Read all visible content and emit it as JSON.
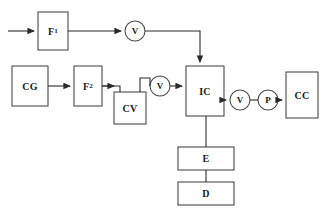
{
  "diagram": {
    "type": "process-flow-block-diagram",
    "title": "",
    "stroke_color": "#4a4a4a",
    "fill_color": "#ffffff",
    "text_color": "#1a1a1a",
    "nodes": [
      {
        "id": "F1",
        "shape": "rect",
        "label": "F",
        "subscript": "1",
        "x": 38,
        "y": 12,
        "w": 30,
        "h": 38
      },
      {
        "id": "V1",
        "shape": "circle",
        "label": "V",
        "subscript": "",
        "cx": 135,
        "cy": 31,
        "r": 10
      },
      {
        "id": "CG",
        "shape": "rect",
        "label": "CG",
        "subscript": "",
        "x": 12,
        "y": 66,
        "w": 36,
        "h": 40
      },
      {
        "id": "F2",
        "shape": "rect",
        "label": "F",
        "subscript": "2",
        "x": 74,
        "y": 66,
        "w": 28,
        "h": 40
      },
      {
        "id": "CV",
        "shape": "rect",
        "label": "CV",
        "subscript": "",
        "x": 114,
        "y": 92,
        "w": 32,
        "h": 32
      },
      {
        "id": "V2",
        "shape": "circle",
        "label": "V",
        "subscript": "",
        "cx": 160,
        "cy": 86,
        "r": 10
      },
      {
        "id": "IC",
        "shape": "rect",
        "label": "IC",
        "subscript": "",
        "x": 186,
        "y": 66,
        "w": 38,
        "h": 50
      },
      {
        "id": "V3",
        "shape": "circle",
        "label": "V",
        "subscript": "",
        "cx": 240,
        "cy": 100,
        "r": 10
      },
      {
        "id": "P",
        "shape": "circle",
        "label": "P",
        "subscript": "",
        "cx": 268,
        "cy": 100,
        "r": 10
      },
      {
        "id": "CC",
        "shape": "rect",
        "label": "CC",
        "subscript": "",
        "x": 286,
        "y": 72,
        "w": 32,
        "h": 46
      },
      {
        "id": "E",
        "shape": "rect",
        "label": "E",
        "subscript": "",
        "x": 178,
        "y": 147,
        "w": 56,
        "h": 23
      },
      {
        "id": "D",
        "shape": "rect",
        "label": "D",
        "subscript": "",
        "x": 178,
        "y": 182,
        "w": 56,
        "h": 23
      }
    ],
    "connections": [
      {
        "from": "inlet",
        "to": "F1",
        "arrow": true
      },
      {
        "from": "F1",
        "to": "V1",
        "arrow": true
      },
      {
        "from": "V1",
        "to": "IC",
        "arrow": true,
        "routing": "right-then-down-into-top"
      },
      {
        "from": "CG",
        "to": "F2",
        "arrow": true
      },
      {
        "from": "F2",
        "to": "CV",
        "arrow": true,
        "routing": "right-then-down-into-top"
      },
      {
        "from": "CV",
        "to": "V2",
        "arrow": false,
        "routing": "up-then-right"
      },
      {
        "from": "V2",
        "to": "IC",
        "arrow": true
      },
      {
        "from": "IC",
        "to": "V3",
        "arrow": true
      },
      {
        "from": "V3",
        "to": "P",
        "arrow": false
      },
      {
        "from": "P",
        "to": "CC",
        "arrow": true
      },
      {
        "from": "IC",
        "to": "E",
        "arrow": false,
        "routing": "down"
      },
      {
        "from": "E",
        "to": "D",
        "arrow": false,
        "routing": "down"
      }
    ]
  }
}
